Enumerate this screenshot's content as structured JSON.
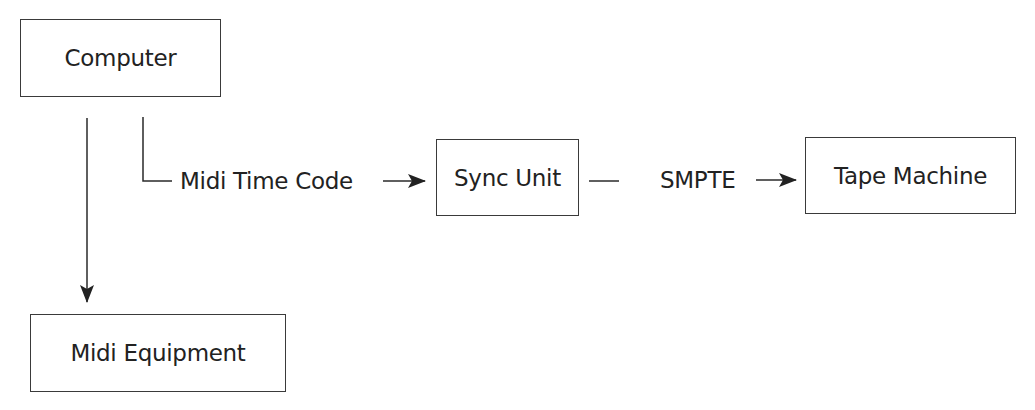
{
  "diagram": {
    "nodes": {
      "computer": "Computer",
      "sync_unit": "Sync Unit",
      "tape_machine": "Tape Machine",
      "midi_equipment": "Midi Equipment"
    },
    "edges": {
      "computer_to_sync": "Midi Time Code",
      "sync_to_tape": "SMPTE",
      "computer_to_midi": ""
    },
    "colors": {
      "line": "#2a2a2a",
      "background": "#ffffff"
    }
  }
}
